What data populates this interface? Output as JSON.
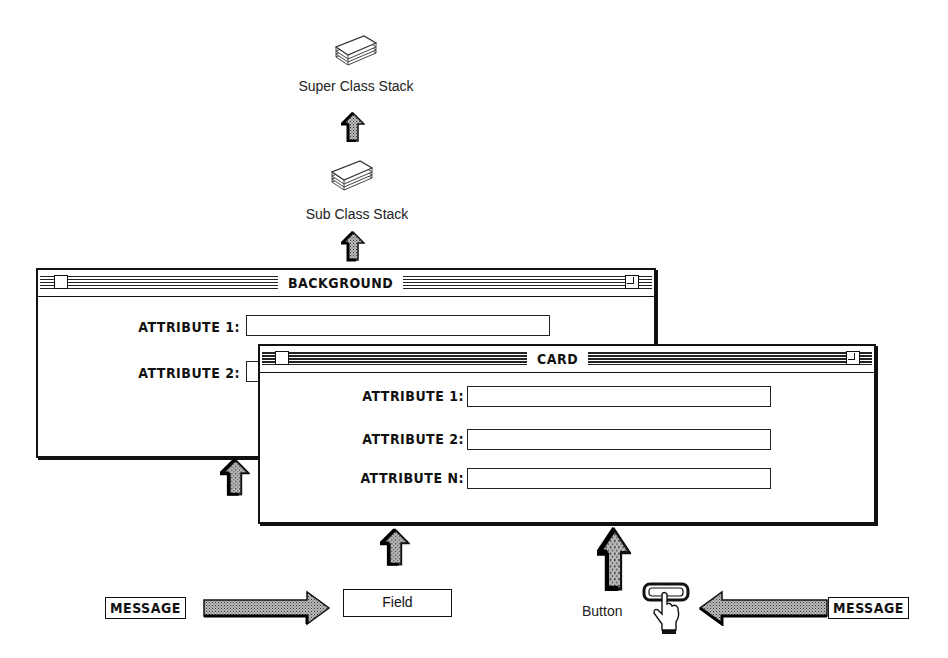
{
  "diagram": {
    "super_stack": {
      "label": "Super Class Stack",
      "icon": "card-stack-icon"
    },
    "sub_stack": {
      "label": "Sub Class Stack",
      "icon": "card-stack-icon"
    },
    "background_window": {
      "title": "BACKGROUND",
      "fields": [
        {
          "label": "ATTRIBUTE 1:",
          "value": ""
        },
        {
          "label": "ATTRIBUTE 2:",
          "value": ""
        }
      ]
    },
    "card_window": {
      "title": "CARD",
      "fields": [
        {
          "label": "ATTRIBUTE 1:",
          "value": ""
        },
        {
          "label": "ATTRIBUTE 2:",
          "value": ""
        },
        {
          "label": "ATTRIBUTE N:",
          "value": ""
        }
      ]
    },
    "bottom": {
      "left_message": "MESSAGE",
      "field_label": "Field",
      "button_label": "Button",
      "button_icon": "hand-pointer-button-icon",
      "right_message": "MESSAGE"
    },
    "arrows": [
      "up-arrow-icon",
      "right-arrow-icon",
      "left-arrow-icon"
    ]
  }
}
